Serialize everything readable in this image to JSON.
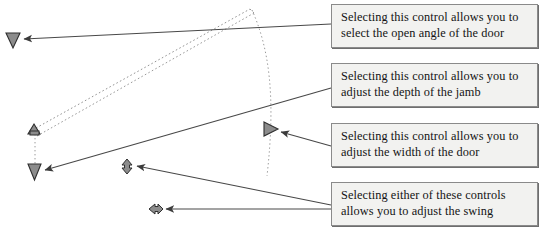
{
  "diagram": {
    "colors": {
      "leader_line": "#454545",
      "door_dashed": "#8f8f8f",
      "grip_fill": "#8c8c8c",
      "grip_stroke": "#3a3a3a",
      "callout_bg": "#f2f2f0",
      "callout_border": "#8a8a8a",
      "text": "#141414"
    },
    "grips": [
      {
        "id": "open-angle-grip",
        "shape": "triangle-down",
        "x": 13,
        "y": 40
      },
      {
        "id": "jamb-depth-grip",
        "shape": "triangle-up",
        "x": 34,
        "y": 130
      },
      {
        "id": "door-width-grip",
        "shape": "triangle-right",
        "x": 271,
        "y": 129
      },
      {
        "id": "swing-grip-lower",
        "shape": "triangle-down",
        "x": 34,
        "y": 172
      },
      {
        "id": "swing-grip-down",
        "shape": "diamond-down",
        "x": 127,
        "y": 166
      },
      {
        "id": "swing-grip-left",
        "shape": "diamond-left",
        "x": 156,
        "y": 209
      }
    ]
  },
  "callouts": [
    {
      "id": "callout-open-angle",
      "line1": "Selecting this control allows you to",
      "line2": "select the open angle of the door",
      "target_grip": "open-angle-grip"
    },
    {
      "id": "callout-jamb-depth",
      "line1": "Selecting this control allows you to",
      "line2": "adjust the depth of the jamb",
      "target_grip": "jamb-depth-grip"
    },
    {
      "id": "callout-door-width",
      "line1": "Selecting this control allows you to",
      "line2": "adjust the width of the door",
      "target_grip": "door-width-grip"
    },
    {
      "id": "callout-swing",
      "line1": "Selecting either of these controls",
      "line2": "allows you to adjust the swing",
      "target_grips": [
        "swing-grip-down",
        "swing-grip-left"
      ]
    }
  ]
}
